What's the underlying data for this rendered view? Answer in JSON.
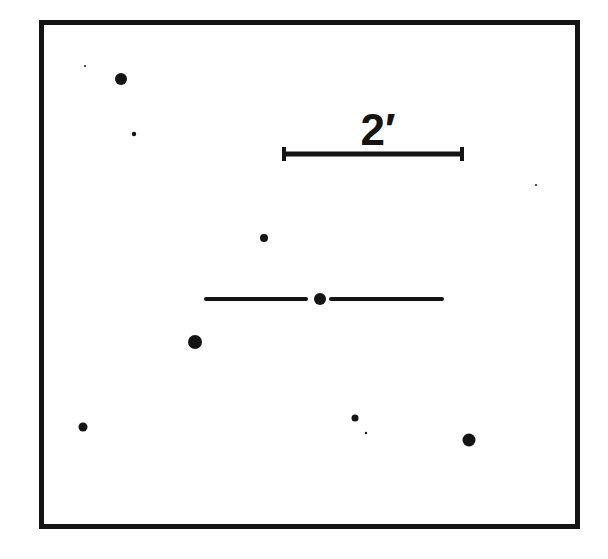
{
  "chart": {
    "kind": "finder-chart",
    "colors": {
      "ink": "#141414",
      "background": "#ffffff"
    },
    "frame": {
      "x": 39,
      "y": 20,
      "width": 541,
      "height": 509,
      "stroke": 5
    },
    "scale_bar": {
      "label": "2′",
      "x1": 284,
      "x2": 462,
      "y": 154,
      "cap_half_height": 7
    },
    "target": {
      "x": 320,
      "y": 299,
      "r": 6,
      "left_marker": {
        "x1": 206,
        "x2": 306
      },
      "right_marker": {
        "x1": 331,
        "x2": 442
      }
    },
    "stars": [
      {
        "x": 121,
        "y": 79,
        "r": 6
      },
      {
        "x": 85,
        "y": 66,
        "r": 1
      },
      {
        "x": 134,
        "y": 134,
        "r": 2.2
      },
      {
        "x": 264,
        "y": 238,
        "r": 4
      },
      {
        "x": 195,
        "y": 342,
        "r": 7
      },
      {
        "x": 83,
        "y": 427,
        "r": 4.5
      },
      {
        "x": 355,
        "y": 418,
        "r": 3.5
      },
      {
        "x": 366,
        "y": 433,
        "r": 1.2
      },
      {
        "x": 469,
        "y": 440,
        "r": 6.5
      },
      {
        "x": 536,
        "y": 185,
        "r": 1
      }
    ]
  }
}
